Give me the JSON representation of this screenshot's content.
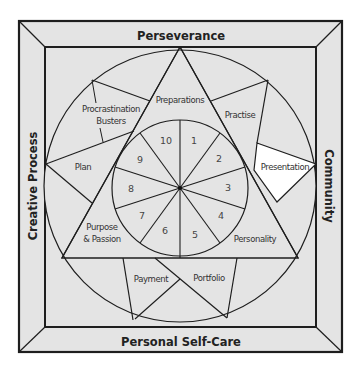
{
  "diagram": {
    "frame": {
      "top": "Perseverance",
      "bottom": "Personal Self-Care",
      "left": "Creative Process",
      "right": "Community"
    },
    "segments": {
      "preparations": "Preparations",
      "practise": "Practise",
      "presentation": "Presentation",
      "personality": "Personality",
      "portfolio": "Portfolio",
      "payment": "Payment",
      "purpose_line1": "Purpose",
      "purpose_line2": "& Passion",
      "plan": "Plan",
      "procrastination_line1": "Procrastination",
      "procrastination_line2": "Busters"
    },
    "wheel_numbers": [
      "1",
      "2",
      "3",
      "4",
      "5",
      "6",
      "7",
      "8",
      "9",
      "10"
    ],
    "colors": {
      "fill": "#e4e4e4",
      "highlight": "#ffffff",
      "stroke": "#1e1e1e"
    }
  }
}
